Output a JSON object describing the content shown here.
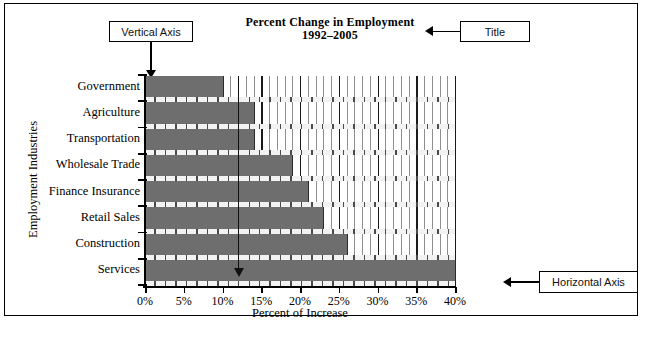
{
  "title": {
    "line1": "Percent Change in Employment",
    "line2": "1992–2005"
  },
  "callouts": [
    {
      "id": "vertical-axis",
      "label": "Vertical Axis"
    },
    {
      "id": "title",
      "label": "Title"
    },
    {
      "id": "horizontal-axis",
      "label": "Horizontal Axis"
    }
  ],
  "axes": {
    "y_title": "Employment Industries",
    "x_title": "Percent of Increase"
  },
  "colors": {
    "bar_fill": "#6e6e6e",
    "bar_edge": "#2b2b2b",
    "gridline": "#8f8f8f",
    "gridline_major": "#1a1a1a",
    "axis": "#000000",
    "background": "#ffffff"
  },
  "chart_data": {
    "type": "bar",
    "orientation": "horizontal",
    "title": "Percent Change in Employment 1992–2005",
    "xlabel": "Percent of Increase",
    "ylabel": "Employment Industries",
    "categories": [
      "Government",
      "Agriculture",
      "Transportation",
      "Wholesale Trade",
      "Finance Insurance",
      "Retail Sales",
      "Construction",
      "Services"
    ],
    "values": [
      10,
      14,
      14,
      19,
      21,
      23,
      26,
      40
    ],
    "value_unit": "%",
    "xlim": [
      0,
      40
    ],
    "xticks": [
      0,
      5,
      10,
      15,
      20,
      25,
      30,
      35,
      40
    ],
    "xtick_labels": [
      "0%",
      "5%",
      "10%",
      "15%",
      "20%",
      "25%",
      "30%",
      "35%",
      "40%"
    ],
    "minor_gridlines_step": 1,
    "grid": true,
    "legend": false
  }
}
